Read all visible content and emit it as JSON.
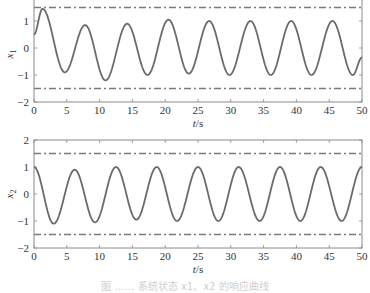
{
  "figure": {
    "caption": "图 …… 系统状态 x1、x2 的响应曲线"
  },
  "colors": {
    "curve": "#6b6b6b",
    "bound": "#7a7a7a",
    "axis": "#8a8a8a",
    "text": "#333333"
  },
  "chart_data": [
    {
      "type": "line",
      "title": "",
      "xlabel": "t/s",
      "ylabel": "x1",
      "xlim": [
        0,
        50
      ],
      "ylim": [
        -2,
        2
      ],
      "xticks": [
        0,
        5,
        10,
        15,
        20,
        25,
        30,
        35,
        40,
        45,
        50
      ],
      "yticks_visible": [
        -2,
        -1,
        0,
        1
      ],
      "grid": false,
      "legend": "none",
      "bounds": [
        {
          "name": "upper bound",
          "y": 1.5,
          "style": "dash-dot"
        },
        {
          "name": "lower bound",
          "y": -1.5,
          "style": "dash-dot"
        }
      ],
      "series": [
        {
          "name": "x1",
          "style": "solid",
          "x": [
            0,
            1.3,
            4.7,
            7.8,
            10.9,
            14.2,
            17.3,
            20.5,
            23.6,
            26.7,
            29.8,
            33.0,
            36.1,
            39.2,
            42.3,
            45.5,
            48.6,
            50
          ],
          "values": [
            0.5,
            1.45,
            -0.9,
            0.85,
            -1.2,
            0.9,
            -1.0,
            1.05,
            -0.95,
            1.0,
            -1.0,
            1.0,
            -1.0,
            1.0,
            -1.0,
            1.0,
            -1.0,
            -0.35
          ]
        }
      ]
    },
    {
      "type": "line",
      "title": "",
      "xlabel": "t/s",
      "ylabel": "x2",
      "xlim": [
        0,
        50
      ],
      "ylim": [
        -2,
        2
      ],
      "xticks": [
        0,
        5,
        10,
        15,
        20,
        25,
        30,
        35,
        40,
        45,
        50
      ],
      "yticks_visible": [
        -2,
        -1,
        0,
        1,
        2
      ],
      "grid": false,
      "legend": "none",
      "bounds": [
        {
          "name": "upper bound",
          "y": 1.5,
          "style": "dash-dot"
        },
        {
          "name": "lower bound",
          "y": -1.5,
          "style": "dash-dot"
        }
      ],
      "series": [
        {
          "name": "x2",
          "style": "solid",
          "x": [
            0,
            3.0,
            6.2,
            9.3,
            12.5,
            15.6,
            18.7,
            21.8,
            25.0,
            28.1,
            31.2,
            34.4,
            37.5,
            40.6,
            43.7,
            46.9,
            50
          ],
          "values": [
            1.0,
            -1.1,
            0.9,
            -1.05,
            1.0,
            -0.95,
            1.0,
            -1.0,
            1.0,
            -1.0,
            1.0,
            -1.0,
            1.0,
            -1.0,
            1.0,
            -1.0,
            1.0
          ]
        }
      ]
    }
  ],
  "layout": {
    "panels": [
      {
        "left": 34,
        "right": 362,
        "top": -6,
        "bottom": 102
      },
      {
        "left": 34,
        "right": 362,
        "top": 140,
        "bottom": 248
      }
    ]
  }
}
